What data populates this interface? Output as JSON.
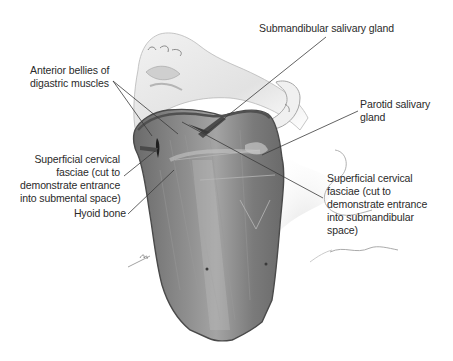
{
  "figure": {
    "colors": {
      "background": "#ffffff",
      "skin_outline": "#9a9a9a",
      "skin_shade": "#e4e4e4",
      "muscle_fill": "#7d7d7d",
      "muscle_dark": "#5c5c5c",
      "muscle_light": "#a8a8a8",
      "leader_line": "#3a3a3a",
      "label_text": "#2a2a2a"
    }
  },
  "labels": {
    "submandibular_gland": "Submandibular salivary gland",
    "anterior_bellies": "Anterior bellies of\ndigastric muscles",
    "parotid_gland": "Parotid salivary\ngland",
    "fascia_submental": "Superficial cervical\nfasciae (cut to\ndemonstrate entrance\ninto submental space)",
    "fascia_submandibular": "Superficial cervical\nfasciae (cut to\ndemonstrate entrance\ninto submandibular\nspace)",
    "hyoid_bone": "Hyoid bone"
  }
}
